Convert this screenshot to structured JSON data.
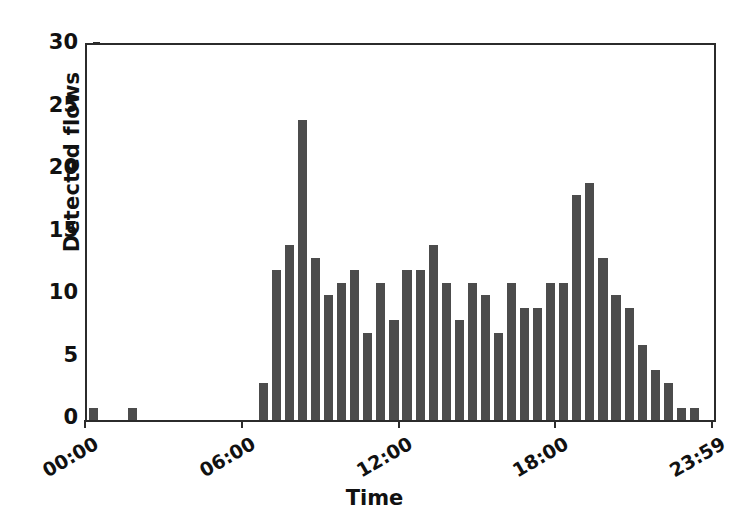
{
  "chart_data": {
    "type": "bar",
    "title": "",
    "xlabel": "Time",
    "ylabel": "Detected flows",
    "ylim": [
      0,
      30
    ],
    "yticks": [
      0,
      5,
      10,
      15,
      20,
      25,
      30
    ],
    "ytick_labels": [
      "0",
      "5",
      "10",
      "15",
      "20",
      "25",
      "30"
    ],
    "xtick_labels": [
      "00:00",
      "06:00",
      "12:00",
      "18:00",
      "23:59"
    ],
    "xtick_positions": [
      0,
      12,
      24,
      36,
      48
    ],
    "grid": false,
    "legend": null,
    "bin_minutes": 30,
    "bar_color": "#4c4c4c",
    "axis_color": "#2b2b2b",
    "background_color": "#ffffff",
    "categories": [
      "00:00",
      "00:30",
      "01:00",
      "01:30",
      "02:00",
      "02:30",
      "03:00",
      "03:30",
      "04:00",
      "04:30",
      "05:00",
      "05:30",
      "06:00",
      "06:30",
      "07:00",
      "07:30",
      "08:00",
      "08:30",
      "09:00",
      "09:30",
      "10:00",
      "10:30",
      "11:00",
      "11:30",
      "12:00",
      "12:30",
      "13:00",
      "13:30",
      "14:00",
      "14:30",
      "15:00",
      "15:30",
      "16:00",
      "16:30",
      "17:00",
      "17:30",
      "18:00",
      "18:30",
      "19:00",
      "19:30",
      "20:00",
      "20:30",
      "21:00",
      "21:30",
      "22:00",
      "22:30",
      "23:00",
      "23:30"
    ],
    "values": [
      1,
      0,
      0,
      1,
      0,
      0,
      0,
      0,
      0,
      0,
      0,
      0,
      0,
      3,
      12,
      14,
      24,
      13,
      10,
      11,
      12,
      7,
      11,
      8,
      12,
      12,
      14,
      11,
      8,
      11,
      10,
      7,
      11,
      9,
      9,
      11,
      11,
      18,
      19,
      13,
      10,
      9,
      6,
      4,
      3,
      1,
      1,
      0
    ]
  },
  "axes": {
    "y_title": "Detected flows",
    "x_title": "Time"
  }
}
